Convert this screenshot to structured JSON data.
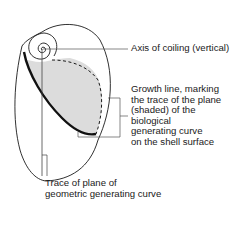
{
  "diagram": {
    "colors": {
      "outline": "#1a1a1a",
      "shaded_plane": "#dcdcdc",
      "leader": "#555555",
      "background": "#ffffff"
    },
    "labels": {
      "axis": {
        "lines": [
          "Axis of coiling (vertical)"
        ]
      },
      "growth_line": {
        "lines": [
          "Growth line, marking",
          "the trace of the plane",
          "(shaded) of the",
          "biological",
          "generating curve",
          "on the shell surface"
        ]
      },
      "trace": {
        "lines": [
          "Trace of plane of",
          "geometric generating curve"
        ]
      }
    }
  }
}
